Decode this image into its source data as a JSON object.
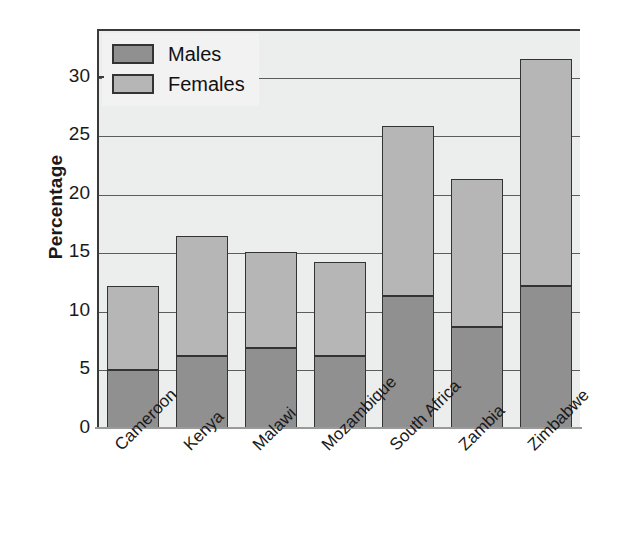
{
  "chart_data": {
    "type": "bar",
    "stacked": true,
    "title": "",
    "subtitle": "",
    "xlabel": "",
    "ylabel": "Percentage",
    "ylim": [
      0,
      34
    ],
    "yticks": [
      0,
      5,
      10,
      15,
      20,
      25,
      30
    ],
    "ytick_labels": [
      "0",
      "5",
      "10",
      "15",
      "20",
      "25",
      "30"
    ],
    "grid": true,
    "legend_position": "top-left",
    "categories": [
      "Cameroon",
      "Kenya",
      "Malawi",
      "Mozambique",
      "South Africa",
      "Zambia",
      "Zimbabwe"
    ],
    "series": [
      {
        "name": "Males",
        "color": "#909090",
        "values": [
          5.0,
          6.2,
          6.9,
          6.2,
          11.4,
          8.7,
          12.2
        ]
      },
      {
        "name": "Females",
        "color": "#b6b6b6",
        "values": [
          7.2,
          10.3,
          8.2,
          8.1,
          14.5,
          12.7,
          19.4
        ]
      }
    ],
    "totals": [
      12.2,
      16.5,
      15.1,
      14.3,
      25.9,
      21.4,
      31.6
    ]
  },
  "legend": {
    "items": [
      {
        "label": "Males",
        "swatch": "males-swatch"
      },
      {
        "label": "Females",
        "swatch": "females-swatch"
      }
    ]
  },
  "axes": {
    "y_title": "Percentage"
  },
  "colors": {
    "males": "#909090",
    "females": "#b6b6b6",
    "plot_background": "#eceded",
    "axis": "#3a3a3a",
    "gridline": "#5c5c5c",
    "page_background": "#ffffff"
  }
}
